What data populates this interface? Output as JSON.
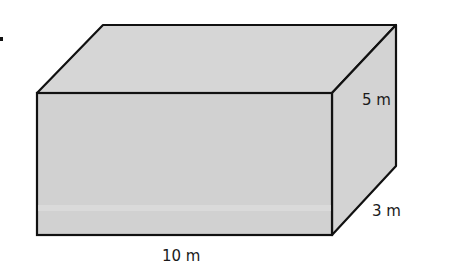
{
  "figure": {
    "shape": "rectangular prism",
    "fill_color": "#d3d3d3",
    "edge_color": "#111111",
    "dimensions": {
      "length": "10 m",
      "width": "3 m",
      "height": "5 m"
    }
  }
}
